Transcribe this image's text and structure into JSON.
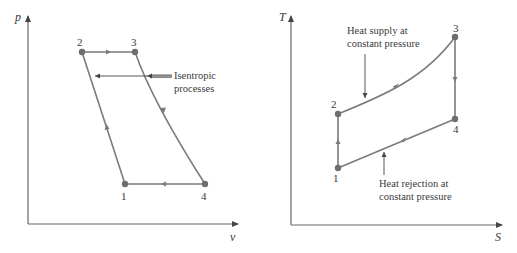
{
  "colors": {
    "axis": "#555555",
    "cycle": "#7a7a7a",
    "point": "#6e6e6e",
    "annotation": "#444444",
    "text": "#3a3a3a"
  },
  "diagrams": [
    {
      "id": "pv",
      "title": "p-v diagram",
      "y_axis_label": "p",
      "x_axis_label": "v",
      "points": [
        {
          "label": "1",
          "x": 125,
          "y": 184
        },
        {
          "label": "2",
          "x": 82,
          "y": 52
        },
        {
          "label": "3",
          "x": 135,
          "y": 52
        },
        {
          "label": "4",
          "x": 205,
          "y": 184
        }
      ],
      "annotation": {
        "line1": "Isentropic",
        "line2": "processes"
      }
    },
    {
      "id": "ts",
      "title": "T-S diagram",
      "y_axis_label": "T",
      "x_axis_label": "S",
      "points": [
        {
          "label": "1",
          "x": 338,
          "y": 168
        },
        {
          "label": "2",
          "x": 338,
          "y": 114
        },
        {
          "label": "3",
          "x": 455,
          "y": 37
        },
        {
          "label": "4",
          "x": 455,
          "y": 119
        }
      ],
      "annotation_top": {
        "line1": "Heat supply at",
        "line2": "constant pressure"
      },
      "annotation_bottom": {
        "line1": "Heat rejection at",
        "line2": "constant pressure"
      }
    }
  ]
}
